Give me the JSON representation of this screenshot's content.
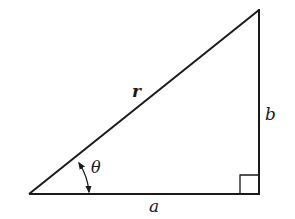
{
  "diagram": {
    "type": "right-triangle",
    "vertices": {
      "origin": [
        29,
        194
      ],
      "right_angle": [
        259,
        194
      ],
      "apex": [
        259,
        10
      ]
    },
    "labels": {
      "hypotenuse": "r",
      "opposite": "b",
      "adjacent": "a",
      "angle": "θ"
    },
    "right_angle_marker": true,
    "angle_arc_double_arrow": true,
    "stroke_color": "#1a1a1a",
    "background": "#ffffff"
  }
}
